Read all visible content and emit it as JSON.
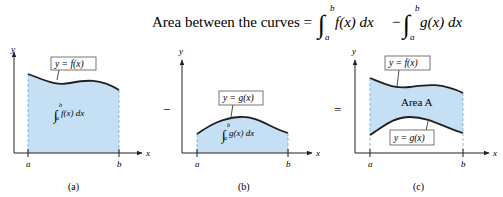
{
  "title": {
    "prefix": "Area between the curves =",
    "int1_upper": "b",
    "int1_lower": "a",
    "int1_body": "f(x) dx",
    "minus": "−",
    "int2_upper": "b",
    "int2_lower": "a",
    "int2_body": "g(x) dx"
  },
  "colors": {
    "fill": "#c5e0f5",
    "stroke": "#231f20",
    "dash": "#6fa9d6"
  },
  "panels": [
    {
      "caption": "(a)",
      "y_axis_label": "y",
      "x_axis_label": "x",
      "tick_a": "a",
      "tick_b": "b",
      "curve_label": "y = f(x)",
      "integral_upper": "b",
      "integral_lower": "a",
      "integral_body": "f(x) dx"
    },
    {
      "caption": "(b)",
      "y_axis_label": "y",
      "x_axis_label": "x",
      "tick_a": "a",
      "tick_b": "b",
      "curve_label": "y = g(x)",
      "integral_upper": "b",
      "integral_lower": "a",
      "integral_body": "g(x) dx"
    },
    {
      "caption": "(c)",
      "y_axis_label": "y",
      "x_axis_label": "x",
      "tick_a": "a",
      "tick_b": "b",
      "top_curve_label": "y = f(x)",
      "bottom_curve_label": "y = g(x)",
      "region_label": "Area A"
    }
  ],
  "operators": {
    "minus": "−",
    "equals": "="
  }
}
